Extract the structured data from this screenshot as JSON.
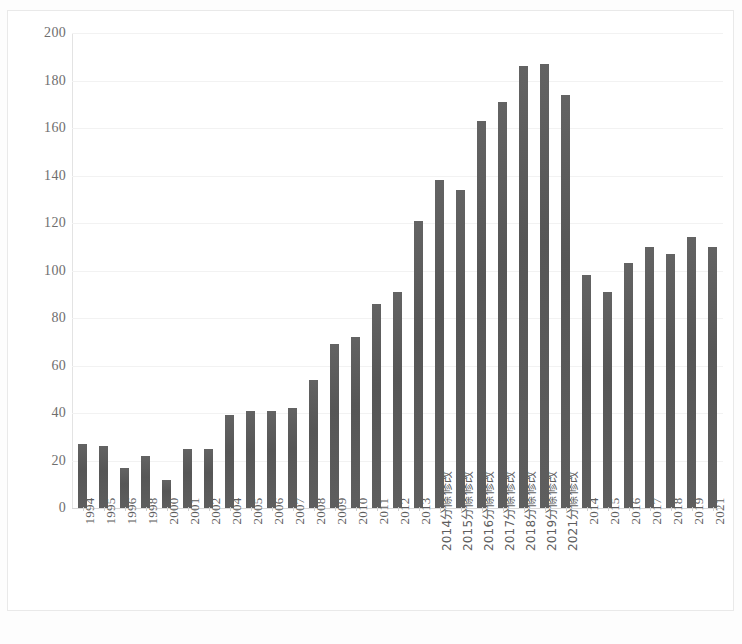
{
  "chart_data": {
    "type": "bar",
    "title": "",
    "subtitle": "",
    "xlabel": "",
    "ylabel": "",
    "ylim": [
      0,
      200
    ],
    "ytick_step": 20,
    "yticks": [
      200,
      180,
      160,
      140,
      120,
      100,
      80,
      60,
      40,
      20,
      0
    ],
    "grid": true,
    "legend": false,
    "legend_position": "none",
    "orientation": "vertical",
    "bar_color": "#5a5a5a",
    "categories": [
      "1994",
      "1995",
      "1996",
      "1998",
      "2000",
      "2001",
      "2002",
      "2004",
      "2005",
      "2006",
      "2007",
      "2008",
      "2009",
      "2010",
      "2011",
      "2012",
      "2013",
      "2014分條修改",
      "2015分條修改",
      "2016分條修改",
      "2017分條修改",
      "2018分條修改",
      "2019分條修改",
      "2021分條修改",
      "2014",
      "2015",
      "2016",
      "2017",
      "2018",
      "2019",
      "2021"
    ],
    "values": [
      27,
      26,
      17,
      22,
      12,
      25,
      25,
      39,
      41,
      41,
      42,
      54,
      69,
      72,
      86,
      91,
      121,
      138,
      134,
      163,
      171,
      186,
      187,
      174,
      98,
      91,
      103,
      110,
      107,
      114,
      110
    ]
  },
  "axes": {
    "y_tick_labels": [
      "200",
      "180",
      "160",
      "140",
      "120",
      "100",
      "80",
      "60",
      "40",
      "20",
      "0"
    ]
  }
}
